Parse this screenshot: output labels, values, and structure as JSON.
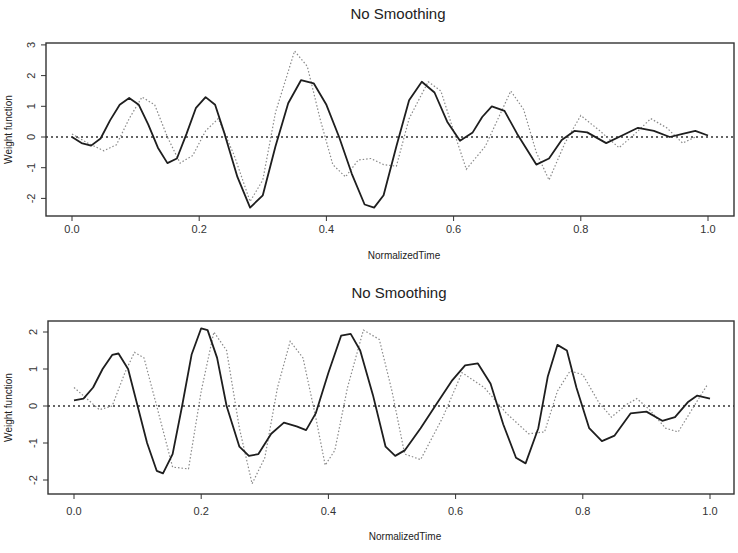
{
  "chart_data": [
    {
      "type": "line",
      "title": "No Smoothing",
      "xlabel": "NormalizedTime",
      "ylabel": "Weight function",
      "xlim": [
        -0.04,
        1.04
      ],
      "ylim": [
        -2.6,
        3.05
      ],
      "xticks": [
        0.0,
        0.2,
        0.4,
        0.6,
        0.8,
        1.0
      ],
      "xtick_labels": [
        "0.0",
        "0.2",
        "0.4",
        "0.6",
        "0.8",
        "1.0"
      ],
      "yticks": [
        -2,
        -1,
        0,
        1,
        2,
        3
      ],
      "ytick_labels": [
        "-2",
        "-1",
        "0",
        "1",
        "2",
        "3"
      ],
      "grid": false,
      "legend": null,
      "reference_line": {
        "y": 0,
        "style": "dotted"
      },
      "series": [
        {
          "name": "solid",
          "style": "solid",
          "x": [
            0.0,
            0.015,
            0.03,
            0.045,
            0.06,
            0.075,
            0.09,
            0.105,
            0.12,
            0.135,
            0.15,
            0.165,
            0.18,
            0.195,
            0.21,
            0.225,
            0.24,
            0.26,
            0.28,
            0.3,
            0.32,
            0.34,
            0.36,
            0.38,
            0.4,
            0.42,
            0.44,
            0.46,
            0.475,
            0.49,
            0.51,
            0.53,
            0.55,
            0.57,
            0.59,
            0.61,
            0.63,
            0.645,
            0.66,
            0.68,
            0.7,
            0.73,
            0.75,
            0.77,
            0.79,
            0.81,
            0.84,
            0.865,
            0.89,
            0.915,
            0.94,
            0.96,
            0.98,
            1.0
          ],
          "y": [
            0.0,
            -0.2,
            -0.28,
            -0.05,
            0.55,
            1.05,
            1.27,
            1.05,
            0.4,
            -0.35,
            -0.85,
            -0.7,
            0.1,
            0.95,
            1.3,
            1.05,
            0.1,
            -1.3,
            -2.3,
            -1.9,
            -0.3,
            1.1,
            1.85,
            1.75,
            1.05,
            0.0,
            -1.2,
            -2.2,
            -2.3,
            -1.9,
            -0.3,
            1.2,
            1.8,
            1.45,
            0.5,
            -0.12,
            0.15,
            0.65,
            1.0,
            0.85,
            0.1,
            -0.9,
            -0.7,
            -0.1,
            0.2,
            0.15,
            -0.2,
            0.05,
            0.3,
            0.2,
            0.0,
            0.1,
            0.2,
            0.05
          ]
        },
        {
          "name": "dotted",
          "style": "dotted",
          "x": [
            0.0,
            0.025,
            0.05,
            0.07,
            0.09,
            0.11,
            0.13,
            0.15,
            0.17,
            0.19,
            0.21,
            0.23,
            0.255,
            0.28,
            0.3,
            0.32,
            0.35,
            0.37,
            0.39,
            0.41,
            0.43,
            0.45,
            0.47,
            0.49,
            0.51,
            0.53,
            0.56,
            0.58,
            0.6,
            0.62,
            0.65,
            0.69,
            0.71,
            0.73,
            0.75,
            0.775,
            0.8,
            0.83,
            0.86,
            0.885,
            0.91,
            0.935,
            0.96,
            0.98
          ],
          "y": [
            0.1,
            -0.2,
            -0.45,
            -0.25,
            0.6,
            1.3,
            1.05,
            0.0,
            -0.85,
            -0.6,
            0.2,
            0.6,
            -0.6,
            -2.1,
            -1.4,
            0.8,
            2.8,
            2.3,
            0.6,
            -0.9,
            -1.3,
            -0.75,
            -0.7,
            -0.9,
            -0.95,
            0.6,
            1.8,
            1.5,
            0.2,
            -1.05,
            -0.3,
            1.5,
            0.9,
            -0.5,
            -1.4,
            -0.2,
            0.7,
            0.2,
            -0.35,
            0.1,
            0.6,
            0.3,
            -0.2,
            0.0
          ]
        }
      ]
    },
    {
      "type": "line",
      "title": "No Smoothing",
      "xlabel": "NormalizedTime",
      "ylabel": "Weight function",
      "xlim": [
        -0.04,
        1.04
      ],
      "ylim": [
        -2.4,
        2.3
      ],
      "xticks": [
        0.0,
        0.2,
        0.4,
        0.6,
        0.8,
        1.0
      ],
      "xtick_labels": [
        "0.0",
        "0.2",
        "0.4",
        "0.6",
        "0.8",
        "1.0"
      ],
      "yticks": [
        -2,
        -1,
        0,
        1,
        2
      ],
      "ytick_labels": [
        "-2",
        "-1",
        "0",
        "1",
        "2"
      ],
      "grid": false,
      "legend": null,
      "reference_line": {
        "y": 0,
        "style": "dotted"
      },
      "series": [
        {
          "name": "solid",
          "style": "solid",
          "x": [
            0.0,
            0.015,
            0.03,
            0.045,
            0.06,
            0.07,
            0.085,
            0.1,
            0.115,
            0.13,
            0.14,
            0.155,
            0.17,
            0.185,
            0.2,
            0.21,
            0.225,
            0.24,
            0.26,
            0.275,
            0.29,
            0.31,
            0.33,
            0.35,
            0.365,
            0.38,
            0.4,
            0.42,
            0.435,
            0.45,
            0.47,
            0.49,
            0.505,
            0.52,
            0.545,
            0.57,
            0.595,
            0.615,
            0.635,
            0.655,
            0.675,
            0.695,
            0.71,
            0.73,
            0.745,
            0.76,
            0.775,
            0.79,
            0.81,
            0.83,
            0.85,
            0.875,
            0.9,
            0.925,
            0.945,
            0.965,
            0.98,
            1.0
          ],
          "y": [
            0.15,
            0.2,
            0.5,
            1.0,
            1.38,
            1.42,
            1.0,
            0.0,
            -1.0,
            -1.75,
            -1.82,
            -1.3,
            0.0,
            1.4,
            2.1,
            2.05,
            1.3,
            0.0,
            -1.1,
            -1.35,
            -1.3,
            -0.75,
            -0.45,
            -0.55,
            -0.65,
            -0.2,
            0.9,
            1.9,
            1.95,
            1.5,
            0.3,
            -1.1,
            -1.35,
            -1.2,
            -0.6,
            0.05,
            0.7,
            1.1,
            1.15,
            0.6,
            -0.5,
            -1.4,
            -1.55,
            -0.6,
            0.8,
            1.65,
            1.5,
            0.5,
            -0.6,
            -0.95,
            -0.8,
            -0.2,
            -0.15,
            -0.4,
            -0.3,
            0.1,
            0.28,
            0.2
          ]
        },
        {
          "name": "dotted",
          "style": "dotted",
          "x": [
            0.0,
            0.02,
            0.04,
            0.06,
            0.08,
            0.095,
            0.11,
            0.13,
            0.155,
            0.18,
            0.2,
            0.22,
            0.24,
            0.26,
            0.28,
            0.3,
            0.32,
            0.34,
            0.36,
            0.38,
            0.395,
            0.41,
            0.43,
            0.455,
            0.48,
            0.5,
            0.52,
            0.545,
            0.58,
            0.61,
            0.645,
            0.68,
            0.715,
            0.74,
            0.76,
            0.78,
            0.8,
            0.825,
            0.845,
            0.87,
            0.885,
            0.905,
            0.93,
            0.95,
            0.975,
            0.995
          ],
          "y": [
            0.5,
            0.2,
            -0.1,
            0.0,
            0.9,
            1.45,
            1.3,
            0.0,
            -1.65,
            -1.7,
            0.4,
            2.0,
            1.5,
            -0.6,
            -2.1,
            -1.4,
            0.5,
            1.75,
            1.3,
            -0.3,
            -1.6,
            -1.2,
            0.5,
            2.05,
            1.8,
            0.4,
            -1.3,
            -1.45,
            -0.3,
            0.9,
            0.5,
            -0.2,
            -0.75,
            -0.7,
            0.4,
            0.95,
            0.85,
            0.1,
            -0.3,
            0.05,
            0.2,
            -0.1,
            -0.6,
            -0.7,
            0.0,
            0.55
          ]
        }
      ]
    }
  ],
  "charts": [
    {
      "title": "No Smoothing",
      "xlabel": "NormalizedTime",
      "ylabel": "Weight function"
    },
    {
      "title": "No Smoothing",
      "xlabel": "NormalizedTime",
      "ylabel": "Weight function"
    }
  ],
  "layout": [
    {
      "plot_left": 46,
      "plot_right": 734,
      "plot_top": 43,
      "plot_bottom": 216,
      "x0px": 72,
      "x1px": 708,
      "y0": 0,
      "y0px": 137,
      "pxPerY": 30.7,
      "title_y": 19,
      "xtick_label_y": 233,
      "xlabel_y": 259,
      "ylabel_x": 12
    },
    {
      "plot_left": 48,
      "plot_right": 734,
      "plot_top": 321,
      "plot_bottom": 494,
      "x0px": 74,
      "x1px": 710,
      "y0": 0,
      "y0px": 406,
      "pxPerY": 37,
      "title_y": 298,
      "xtick_label_y": 515,
      "xlabel_y": 540,
      "ylabel_x": 12
    }
  ],
  "colors": {
    "solid": "#1e1e1e",
    "dotted": "#8a8a8a",
    "axis": "#333333",
    "zero_line": "#333333"
  }
}
